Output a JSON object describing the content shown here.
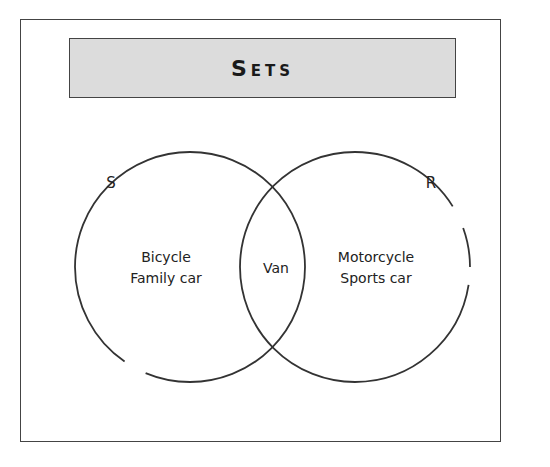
{
  "title": "Sets",
  "sets": [
    {
      "name": "S",
      "only_items": [
        "Bicycle",
        "Family car"
      ]
    },
    {
      "name": "R",
      "only_items": [
        "Motorcycle",
        "Sports car"
      ]
    }
  ],
  "intersection": [
    "Van"
  ],
  "colors": {
    "title_bg": "#dcdcdc",
    "stroke": "#333333"
  }
}
